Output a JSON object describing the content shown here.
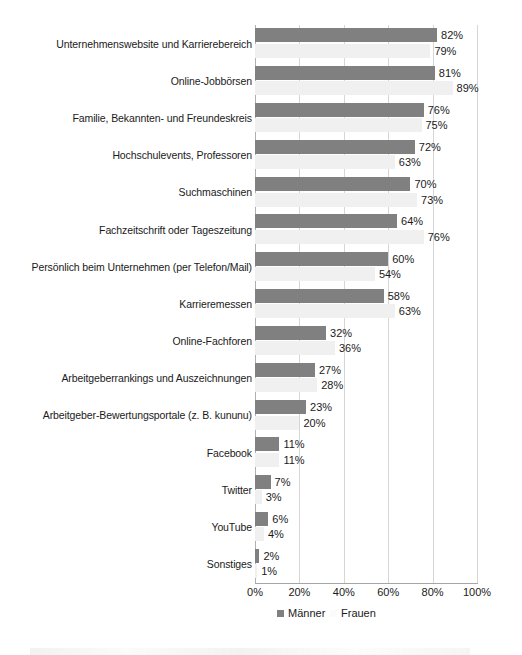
{
  "chart_data": {
    "type": "bar",
    "orientation": "horizontal",
    "title": "",
    "subtitle": "",
    "xlabel": "",
    "ylabel": "",
    "xlim": [
      0,
      100
    ],
    "xticks": [
      "0%",
      "20%",
      "40%",
      "60%",
      "80%",
      "100%"
    ],
    "xtick_values": [
      0,
      20,
      40,
      60,
      80,
      100
    ],
    "grid": true,
    "grid_axis": "x",
    "legend_position": "bottom",
    "value_suffix": "%",
    "categories": [
      "Unternehmenswebsite und Karrierebereich",
      "Online-Jobbörsen",
      "Familie, Bekannten- und Freundeskreis",
      "Hochschulevents, Professoren",
      "Suchmaschinen",
      "Fachzeitschrift oder Tageszeitung",
      "Persönlich beim Unternehmen (per Telefon/Mail)",
      "Karrieremessen",
      "Online-Fachforen",
      "Arbeitgeberrankings und Auszeichnungen",
      "Arbeitgeber-Bewertungsportale (z. B. kununu)",
      "Facebook",
      "Twitter",
      "YouTube",
      "Sonstiges"
    ],
    "series": [
      {
        "name": "Männer",
        "color": "#808080",
        "values": [
          82,
          81,
          76,
          72,
          70,
          64,
          60,
          58,
          32,
          27,
          23,
          11,
          7,
          6,
          2
        ],
        "labels": [
          "82%",
          "81%",
          "76%",
          "72%",
          "70%",
          "64%",
          "60%",
          "58%",
          "32%",
          "27%",
          "23%",
          "11%",
          "7%",
          "6%",
          "2%"
        ]
      },
      {
        "name": "Frauen",
        "color": "#f0f0f0",
        "values": [
          79,
          89,
          75,
          63,
          73,
          76,
          54,
          63,
          36,
          28,
          20,
          11,
          3,
          4,
          1
        ],
        "labels": [
          "79%",
          "89%",
          "75%",
          "63%",
          "73%",
          "76%",
          "54%",
          "63%",
          "36%",
          "28%",
          "20%",
          "11%",
          "3%",
          "4%",
          "1%"
        ]
      }
    ]
  },
  "legend": {
    "items": [
      {
        "label": "Männer",
        "color": "#808080"
      },
      {
        "label": "Frauen",
        "color": "#fbfbfb"
      }
    ]
  }
}
